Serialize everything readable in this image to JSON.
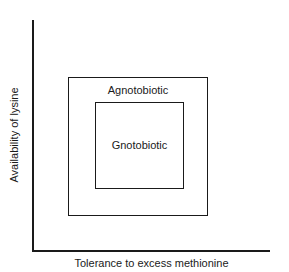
{
  "diagram": {
    "type": "nested-regions",
    "axes": {
      "x_label": "Tolerance to excess methionine",
      "y_label": "Availability of lysine"
    },
    "regions": [
      {
        "name": "outer",
        "label": "Agnotobiotic"
      },
      {
        "name": "inner",
        "label": "Gnotobiotic"
      }
    ],
    "colors": {
      "line": "#1a1a1a",
      "background": "#ffffff"
    }
  }
}
